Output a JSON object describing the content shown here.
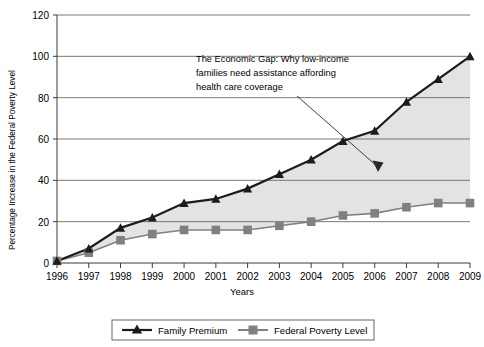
{
  "chart_data": {
    "type": "line",
    "title": "",
    "xlabel": "Years",
    "ylabel": "Percentage Increase in the Federal Poverty Level",
    "categories": [
      "1996",
      "1997",
      "1998",
      "1999",
      "2000",
      "2001",
      "2002",
      "2003",
      "2004",
      "2005",
      "2006",
      "2007",
      "2008",
      "2009"
    ],
    "xlim": [
      1996,
      2009
    ],
    "ylim": [
      0,
      120
    ],
    "yticks": [
      0,
      20,
      40,
      60,
      80,
      100,
      120
    ],
    "grid": true,
    "legend_position": "bottom",
    "series": [
      {
        "name": "Family Premium",
        "marker": "triangle",
        "color": "#1c1c1c",
        "values": [
          1,
          7,
          17,
          22,
          29,
          31,
          36,
          43,
          50,
          59,
          64,
          78,
          89,
          100
        ]
      },
      {
        "name": "Federal Poverty Level",
        "marker": "square",
        "color": "#808080",
        "values": [
          1,
          5,
          11,
          14,
          16,
          16,
          16,
          18,
          20,
          23,
          24,
          27,
          29,
          29
        ]
      }
    ],
    "shaded_gap": {
      "label": "gap-between-series",
      "color": "#e3e3e3"
    },
    "annotations": [
      {
        "name": "economic-gap-annotation",
        "lines": [
          "The Economic Gap: Why low-income",
          "families need assistance affording",
          "health care coverage"
        ],
        "arrow": true
      }
    ]
  },
  "legend": {
    "items": [
      {
        "label": "Family Premium",
        "marker": "triangle"
      },
      {
        "label": "Federal Poverty Level",
        "marker": "square"
      }
    ]
  },
  "axes": {
    "y_tick_labels": [
      "120",
      "100",
      "80",
      "60",
      "40",
      "20",
      "0"
    ],
    "x_tick_labels": [
      "1996",
      "1997",
      "1998",
      "1999",
      "2000",
      "2001",
      "2002",
      "2003",
      "2004",
      "2005",
      "2006",
      "2007",
      "2008",
      "2009"
    ],
    "y_axis_title": "Percentage Increase in the Federal Poverty Level",
    "x_axis_title": "Years"
  },
  "annotation": {
    "line1": "The Economic Gap: Why low-income",
    "line2": "families need assistance affording",
    "line3": "health care coverage"
  },
  "colors": {
    "premium_line": "#1c1c1c",
    "poverty_line": "#808080",
    "gap_fill": "#e3e3e3",
    "gridline": "#6b6b6b",
    "axis": "#3a3a3a"
  }
}
